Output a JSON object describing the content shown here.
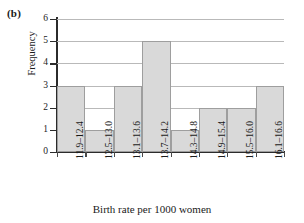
{
  "panel": {
    "label": "(b)"
  },
  "chart_data": {
    "type": "bar",
    "title": "",
    "subtitle": "",
    "xlabel": "Birth rate per 1000 women",
    "ylabel": "Frequency",
    "categories": [
      "11.9–12.4",
      "12.5–13.0",
      "13.1–13.6",
      "13.7–14.2",
      "14.3–14.8",
      "14.9–15.4",
      "15.5–16.0",
      "16.1–16.6"
    ],
    "values": [
      3,
      1,
      3,
      5,
      1,
      2,
      2,
      3
    ],
    "ylim": [
      0,
      6
    ],
    "yticks": [
      0,
      1,
      2,
      3,
      4,
      5,
      6
    ],
    "grid": "horizontal",
    "legend": "none",
    "bar_fill": "#d9d9d9",
    "bar_edge": "#9e9e9e",
    "axis_color": "#2b2b2b",
    "grid_color": "#b9b9b9"
  }
}
